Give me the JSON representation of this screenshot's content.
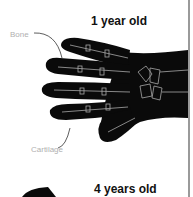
{
  "figure": {
    "panels": [
      {
        "title": "1 year old"
      },
      {
        "title": "4 years old"
      }
    ],
    "labels": {
      "bone": "Bone",
      "cartilage": "Cartilage"
    },
    "colors": {
      "hand": "#0a0a0a",
      "bone_lines": "#cfcfcf",
      "label_text": "#b0b0b0",
      "title_text": "#111111",
      "divider": "#9a9a9a"
    }
  }
}
